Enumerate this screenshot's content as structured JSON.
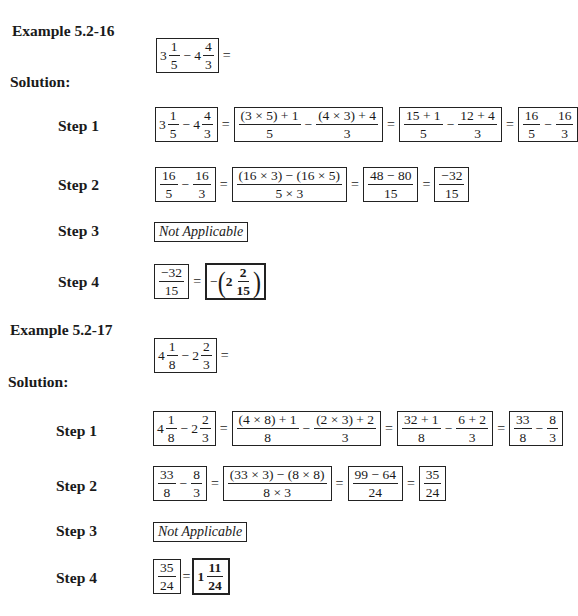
{
  "examples": [
    {
      "title": "Example 5.2-16",
      "problem": {
        "whole1": "3",
        "num1": "1",
        "den1": "5",
        "op": "−",
        "whole2": "4",
        "num2": "4",
        "den2": "3",
        "eq": "="
      },
      "solution_label": "Solution:",
      "steps": [
        {
          "label": "Step 1",
          "expr": {
            "b1": {
              "whole1": "3",
              "num1": "1",
              "den1": "5",
              "op": "−",
              "whole2": "4",
              "num2": "4",
              "den2": "3"
            },
            "b2": {
              "num1": "(3 × 5) + 1",
              "den1": "5",
              "op": "−",
              "num2": "(4 × 3) + 4",
              "den2": "3"
            },
            "b3": {
              "num1": "15 + 1",
              "den1": "5",
              "op": "−",
              "num2": "12 + 4",
              "den2": "3"
            },
            "b4": {
              "num1": "16",
              "den1": "5",
              "op": "−",
              "num2": "16",
              "den2": "3"
            },
            "eq": "="
          }
        },
        {
          "label": "Step 2",
          "expr": {
            "b1": {
              "num1": "16",
              "den1": "5",
              "op": "−",
              "num2": "16",
              "den2": "3"
            },
            "b2": {
              "num": "(16 × 3) − (16 × 5)",
              "den": "5 × 3"
            },
            "b3": {
              "num": "48 − 80",
              "den": "15"
            },
            "b4": {
              "num": "−32",
              "den": "15"
            },
            "eq": "="
          }
        },
        {
          "label": "Step 3",
          "text": "Not Applicable"
        },
        {
          "label": "Step 4",
          "expr": {
            "b1": {
              "num": "−32",
              "den": "15"
            },
            "result": {
              "sign": "−",
              "lparen": "(",
              "whole": "2",
              "num": "2",
              "den": "15",
              "rparen": ")"
            },
            "eq": "="
          }
        }
      ]
    },
    {
      "title": "Example 5.2-17",
      "problem": {
        "whole1": "4",
        "num1": "1",
        "den1": "8",
        "op": "−",
        "whole2": "2",
        "num2": "2",
        "den2": "3",
        "eq": "="
      },
      "solution_label": "Solution:",
      "steps": [
        {
          "label": "Step 1",
          "expr": {
            "b1": {
              "whole1": "4",
              "num1": "1",
              "den1": "8",
              "op": "−",
              "whole2": "2",
              "num2": "2",
              "den2": "3"
            },
            "b2": {
              "num1": "(4 × 8) + 1",
              "den1": "8",
              "op": "−",
              "num2": "(2 × 3) + 2",
              "den2": "3"
            },
            "b3": {
              "num1": "32 + 1",
              "den1": "8",
              "op": "−",
              "num2": "6 + 2",
              "den2": "3"
            },
            "b4": {
              "num1": "33",
              "den1": "8",
              "op": "−",
              "num2": "8",
              "den2": "3"
            },
            "eq": "="
          }
        },
        {
          "label": "Step 2",
          "expr": {
            "b1": {
              "num1": "33",
              "den1": "8",
              "op": "−",
              "num2": "8",
              "den2": "3"
            },
            "b2": {
              "num": "(33 × 3) − (8 × 8)",
              "den": "8 × 3"
            },
            "b3": {
              "num": "99 − 64",
              "den": "24"
            },
            "b4": {
              "num": "35",
              "den": "24"
            },
            "eq": "="
          }
        },
        {
          "label": "Step 3",
          "text": "Not Applicable"
        },
        {
          "label": "Step 4",
          "expr": {
            "b1": {
              "num": "35",
              "den": "24"
            },
            "result": {
              "whole": "1",
              "num": "11",
              "den": "24"
            },
            "eq": "="
          }
        }
      ]
    }
  ]
}
